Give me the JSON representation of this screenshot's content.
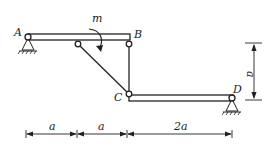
{
  "diagram": {
    "type": "structural-mechanics",
    "points": {
      "A": "A",
      "B": "B",
      "C": "C",
      "D": "D"
    },
    "moment": {
      "label": "m",
      "direction": "clockwise"
    },
    "dimensions": {
      "vertical": "a",
      "horizontal": [
        "a",
        "a",
        "2a"
      ]
    },
    "colors": {
      "stroke": "#222222",
      "background": "#ffffff"
    }
  }
}
